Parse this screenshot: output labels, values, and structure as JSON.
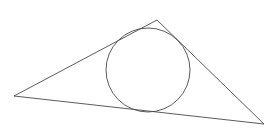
{
  "canvas": {
    "width": 278,
    "height": 131,
    "background_color": "#ffffff",
    "title": "Triangle with inscribed circle"
  },
  "style": {
    "stroke_color": "#4a4a4a",
    "stroke_width": 0.9,
    "fill": "none"
  },
  "figure": {
    "type": "geometry-diagram",
    "triangle": {
      "name": "triangle",
      "vertices": [
        {
          "label": "left-vertex",
          "x": 14,
          "y": 96
        },
        {
          "label": "apex-vertex",
          "x": 157,
          "y": 20
        },
        {
          "label": "right-vertex",
          "x": 264,
          "y": 124
        }
      ],
      "points_attr": "14,96 157,20 264,124",
      "closed": true
    },
    "circle": {
      "name": "inscribed-circle",
      "center_x": 148,
      "center_y": 70,
      "radius": 42
    }
  }
}
